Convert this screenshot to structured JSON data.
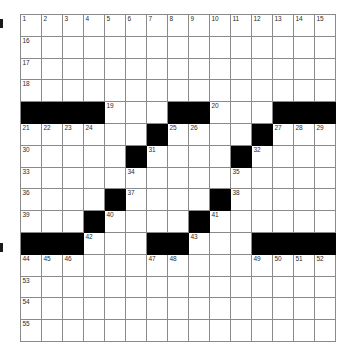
{
  "puzzle": {
    "title": "Crossword Grid",
    "size": 15,
    "colors": {
      "block": "#000000",
      "grid_line": "#8a8a8a",
      "background": "#ffffff",
      "number_text": "#2b2b2b"
    },
    "margin_marks": [
      {
        "name": "margin-mark-top",
        "position": "top"
      },
      {
        "name": "margin-mark-bottom",
        "position": "bottom"
      }
    ],
    "grid": [
      [
        {
          "block": false,
          "num": "1"
        },
        {
          "block": false,
          "num": "2"
        },
        {
          "block": false,
          "num": "3"
        },
        {
          "block": false,
          "num": "4"
        },
        {
          "block": false,
          "num": "5"
        },
        {
          "block": false,
          "num": "6"
        },
        {
          "block": false,
          "num": "7"
        },
        {
          "block": false,
          "num": "8"
        },
        {
          "block": false,
          "num": "9"
        },
        {
          "block": false,
          "num": "10"
        },
        {
          "block": false,
          "num": "11"
        },
        {
          "block": false,
          "num": "12"
        },
        {
          "block": false,
          "num": "13"
        },
        {
          "block": false,
          "num": "14"
        },
        {
          "block": false,
          "num": "15"
        }
      ],
      [
        {
          "block": false,
          "num": "16"
        },
        {
          "block": false,
          "num": ""
        },
        {
          "block": false,
          "num": ""
        },
        {
          "block": false,
          "num": ""
        },
        {
          "block": false,
          "num": ""
        },
        {
          "block": false,
          "num": ""
        },
        {
          "block": false,
          "num": ""
        },
        {
          "block": false,
          "num": ""
        },
        {
          "block": false,
          "num": ""
        },
        {
          "block": false,
          "num": ""
        },
        {
          "block": false,
          "num": ""
        },
        {
          "block": false,
          "num": ""
        },
        {
          "block": false,
          "num": ""
        },
        {
          "block": false,
          "num": ""
        },
        {
          "block": false,
          "num": ""
        }
      ],
      [
        {
          "block": false,
          "num": "17"
        },
        {
          "block": false,
          "num": ""
        },
        {
          "block": false,
          "num": ""
        },
        {
          "block": false,
          "num": ""
        },
        {
          "block": false,
          "num": ""
        },
        {
          "block": false,
          "num": ""
        },
        {
          "block": false,
          "num": ""
        },
        {
          "block": false,
          "num": ""
        },
        {
          "block": false,
          "num": ""
        },
        {
          "block": false,
          "num": ""
        },
        {
          "block": false,
          "num": ""
        },
        {
          "block": false,
          "num": ""
        },
        {
          "block": false,
          "num": ""
        },
        {
          "block": false,
          "num": ""
        },
        {
          "block": false,
          "num": ""
        }
      ],
      [
        {
          "block": false,
          "num": "18"
        },
        {
          "block": false,
          "num": ""
        },
        {
          "block": false,
          "num": ""
        },
        {
          "block": false,
          "num": ""
        },
        {
          "block": false,
          "num": ""
        },
        {
          "block": false,
          "num": ""
        },
        {
          "block": false,
          "num": ""
        },
        {
          "block": false,
          "num": ""
        },
        {
          "block": false,
          "num": ""
        },
        {
          "block": false,
          "num": ""
        },
        {
          "block": false,
          "num": ""
        },
        {
          "block": false,
          "num": ""
        },
        {
          "block": false,
          "num": ""
        },
        {
          "block": false,
          "num": ""
        },
        {
          "block": false,
          "num": ""
        }
      ],
      [
        {
          "block": true,
          "num": ""
        },
        {
          "block": true,
          "num": ""
        },
        {
          "block": true,
          "num": ""
        },
        {
          "block": true,
          "num": ""
        },
        {
          "block": false,
          "num": "19"
        },
        {
          "block": false,
          "num": ""
        },
        {
          "block": false,
          "num": ""
        },
        {
          "block": true,
          "num": ""
        },
        {
          "block": true,
          "num": ""
        },
        {
          "block": false,
          "num": "20"
        },
        {
          "block": false,
          "num": ""
        },
        {
          "block": false,
          "num": ""
        },
        {
          "block": true,
          "num": ""
        },
        {
          "block": true,
          "num": ""
        },
        {
          "block": true,
          "num": ""
        }
      ],
      [
        {
          "block": false,
          "num": "21"
        },
        {
          "block": false,
          "num": "22"
        },
        {
          "block": false,
          "num": "23"
        },
        {
          "block": false,
          "num": "24"
        },
        {
          "block": false,
          "num": ""
        },
        {
          "block": false,
          "num": ""
        },
        {
          "block": true,
          "num": ""
        },
        {
          "block": false,
          "num": "25"
        },
        {
          "block": false,
          "num": "26"
        },
        {
          "block": false,
          "num": ""
        },
        {
          "block": false,
          "num": ""
        },
        {
          "block": true,
          "num": ""
        },
        {
          "block": false,
          "num": "27"
        },
        {
          "block": false,
          "num": "28"
        },
        {
          "block": false,
          "num": "29"
        }
      ],
      [
        {
          "block": false,
          "num": "30"
        },
        {
          "block": false,
          "num": ""
        },
        {
          "block": false,
          "num": ""
        },
        {
          "block": false,
          "num": ""
        },
        {
          "block": false,
          "num": ""
        },
        {
          "block": true,
          "num": ""
        },
        {
          "block": false,
          "num": "31"
        },
        {
          "block": false,
          "num": ""
        },
        {
          "block": false,
          "num": ""
        },
        {
          "block": false,
          "num": ""
        },
        {
          "block": true,
          "num": ""
        },
        {
          "block": false,
          "num": "32"
        },
        {
          "block": false,
          "num": ""
        },
        {
          "block": false,
          "num": ""
        },
        {
          "block": false,
          "num": ""
        }
      ],
      [
        {
          "block": false,
          "num": "33"
        },
        {
          "block": false,
          "num": ""
        },
        {
          "block": false,
          "num": ""
        },
        {
          "block": false,
          "num": ""
        },
        {
          "block": false,
          "num": ""
        },
        {
          "block": false,
          "num": "34"
        },
        {
          "block": false,
          "num": ""
        },
        {
          "block": false,
          "num": ""
        },
        {
          "block": false,
          "num": ""
        },
        {
          "block": false,
          "num": ""
        },
        {
          "block": false,
          "num": "35"
        },
        {
          "block": false,
          "num": ""
        },
        {
          "block": false,
          "num": ""
        },
        {
          "block": false,
          "num": ""
        },
        {
          "block": false,
          "num": ""
        }
      ],
      [
        {
          "block": false,
          "num": "36"
        },
        {
          "block": false,
          "num": ""
        },
        {
          "block": false,
          "num": ""
        },
        {
          "block": false,
          "num": ""
        },
        {
          "block": true,
          "num": ""
        },
        {
          "block": false,
          "num": "37"
        },
        {
          "block": false,
          "num": ""
        },
        {
          "block": false,
          "num": ""
        },
        {
          "block": false,
          "num": ""
        },
        {
          "block": true,
          "num": ""
        },
        {
          "block": false,
          "num": "38"
        },
        {
          "block": false,
          "num": ""
        },
        {
          "block": false,
          "num": ""
        },
        {
          "block": false,
          "num": ""
        },
        {
          "block": false,
          "num": ""
        }
      ],
      [
        {
          "block": false,
          "num": "39"
        },
        {
          "block": false,
          "num": ""
        },
        {
          "block": false,
          "num": ""
        },
        {
          "block": true,
          "num": ""
        },
        {
          "block": false,
          "num": "40"
        },
        {
          "block": false,
          "num": ""
        },
        {
          "block": false,
          "num": ""
        },
        {
          "block": false,
          "num": ""
        },
        {
          "block": true,
          "num": ""
        },
        {
          "block": false,
          "num": "41"
        },
        {
          "block": false,
          "num": ""
        },
        {
          "block": false,
          "num": ""
        },
        {
          "block": false,
          "num": ""
        },
        {
          "block": false,
          "num": ""
        },
        {
          "block": false,
          "num": ""
        }
      ],
      [
        {
          "block": true,
          "num": ""
        },
        {
          "block": true,
          "num": ""
        },
        {
          "block": true,
          "num": ""
        },
        {
          "block": false,
          "num": "42"
        },
        {
          "block": false,
          "num": ""
        },
        {
          "block": false,
          "num": ""
        },
        {
          "block": true,
          "num": ""
        },
        {
          "block": true,
          "num": ""
        },
        {
          "block": false,
          "num": "43"
        },
        {
          "block": false,
          "num": ""
        },
        {
          "block": false,
          "num": ""
        },
        {
          "block": true,
          "num": ""
        },
        {
          "block": true,
          "num": ""
        },
        {
          "block": true,
          "num": ""
        },
        {
          "block": true,
          "num": ""
        }
      ],
      [
        {
          "block": false,
          "num": "44"
        },
        {
          "block": false,
          "num": "45"
        },
        {
          "block": false,
          "num": "46"
        },
        {
          "block": false,
          "num": ""
        },
        {
          "block": false,
          "num": ""
        },
        {
          "block": false,
          "num": ""
        },
        {
          "block": false,
          "num": "47"
        },
        {
          "block": false,
          "num": "48"
        },
        {
          "block": false,
          "num": ""
        },
        {
          "block": false,
          "num": ""
        },
        {
          "block": false,
          "num": ""
        },
        {
          "block": false,
          "num": "49"
        },
        {
          "block": false,
          "num": "50"
        },
        {
          "block": false,
          "num": "51"
        },
        {
          "block": false,
          "num": "52"
        }
      ],
      [
        {
          "block": false,
          "num": "53"
        },
        {
          "block": false,
          "num": ""
        },
        {
          "block": false,
          "num": ""
        },
        {
          "block": false,
          "num": ""
        },
        {
          "block": false,
          "num": ""
        },
        {
          "block": false,
          "num": ""
        },
        {
          "block": false,
          "num": ""
        },
        {
          "block": false,
          "num": ""
        },
        {
          "block": false,
          "num": ""
        },
        {
          "block": false,
          "num": ""
        },
        {
          "block": false,
          "num": ""
        },
        {
          "block": false,
          "num": ""
        },
        {
          "block": false,
          "num": ""
        },
        {
          "block": false,
          "num": ""
        },
        {
          "block": false,
          "num": ""
        }
      ],
      [
        {
          "block": false,
          "num": "54"
        },
        {
          "block": false,
          "num": ""
        },
        {
          "block": false,
          "num": ""
        },
        {
          "block": false,
          "num": ""
        },
        {
          "block": false,
          "num": ""
        },
        {
          "block": false,
          "num": ""
        },
        {
          "block": false,
          "num": ""
        },
        {
          "block": false,
          "num": ""
        },
        {
          "block": false,
          "num": ""
        },
        {
          "block": false,
          "num": ""
        },
        {
          "block": false,
          "num": ""
        },
        {
          "block": false,
          "num": ""
        },
        {
          "block": false,
          "num": ""
        },
        {
          "block": false,
          "num": ""
        },
        {
          "block": false,
          "num": ""
        }
      ],
      [
        {
          "block": false,
          "num": "55"
        },
        {
          "block": false,
          "num": ""
        },
        {
          "block": false,
          "num": ""
        },
        {
          "block": false,
          "num": ""
        },
        {
          "block": false,
          "num": ""
        },
        {
          "block": false,
          "num": ""
        },
        {
          "block": false,
          "num": ""
        },
        {
          "block": false,
          "num": ""
        },
        {
          "block": false,
          "num": ""
        },
        {
          "block": false,
          "num": ""
        },
        {
          "block": false,
          "num": ""
        },
        {
          "block": false,
          "num": ""
        },
        {
          "block": false,
          "num": ""
        },
        {
          "block": false,
          "num": ""
        },
        {
          "block": false,
          "num": ""
        }
      ]
    ]
  }
}
